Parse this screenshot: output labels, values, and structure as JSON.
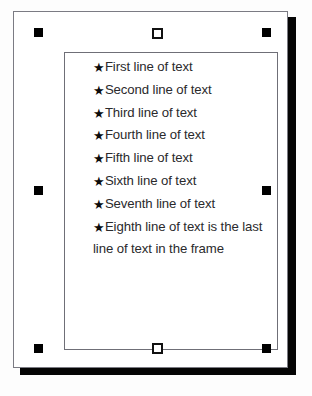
{
  "document": {
    "page_label": "document-page",
    "background_color": "#ffffff",
    "border_color": "#7b7b83",
    "shadow_color": "#050505"
  },
  "text_frame": {
    "label": "selected-text-frame",
    "border_color": "#6f6f77",
    "bullet_glyph": "★",
    "bullet_icon_name": "star-bullet-icon",
    "text_color": "#2a2a2c",
    "lines": [
      {
        "bullet": "★",
        "text": "First line of text"
      },
      {
        "bullet": "★",
        "text": "Second line of text"
      },
      {
        "bullet": "★",
        "text": "Third line of text"
      },
      {
        "bullet": "★",
        "text": "Fourth line of text"
      },
      {
        "bullet": "★",
        "text": "Fifth line of text"
      },
      {
        "bullet": "★",
        "text": "Sixth line of text"
      },
      {
        "bullet": "★",
        "text": "Seventh line of text"
      },
      {
        "bullet": "★",
        "text": "Eighth line of text is the last line of text in the frame"
      }
    ]
  },
  "selection_handles": {
    "top_left": "■",
    "top_center": "□",
    "top_right": "■",
    "middle_left": "■",
    "middle_right": "■",
    "bottom_left": "■",
    "bottom_center": "□",
    "bottom_right": "■",
    "solid_color": "#000000",
    "open_fill": "#ffffff"
  },
  "canvas": {
    "grid_visible": true,
    "grid_dot_color": "#787882",
    "background_color": "#fdfdfd"
  }
}
